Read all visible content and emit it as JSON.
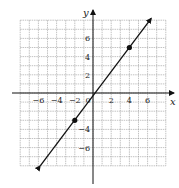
{
  "chart_data": {
    "type": "line",
    "title": "",
    "xlabel": "x",
    "ylabel": "y",
    "xlim": [
      -8,
      8
    ],
    "ylim": [
      -8,
      8
    ],
    "grid": true,
    "grid_step": 1,
    "x_ticks": [
      -6,
      -4,
      -2,
      0,
      2,
      4,
      6
    ],
    "x_tick_labels": [
      "−6",
      "−4",
      "−2",
      "0",
      "2",
      "4",
      "6"
    ],
    "y_ticks": [
      6,
      4,
      2,
      -4,
      -6
    ],
    "y_tick_labels": [
      "6",
      "4",
      "2",
      "−4",
      "−6"
    ],
    "series": [
      {
        "name": "line",
        "x": [
          -5.8,
          6.4
        ],
        "y": [
          -8.0,
          8.2
        ],
        "arrows_both_ends": true,
        "color": "#111111"
      }
    ],
    "points": [
      {
        "x": -2,
        "y": -3
      },
      {
        "x": 4,
        "y": 5
      }
    ]
  }
}
